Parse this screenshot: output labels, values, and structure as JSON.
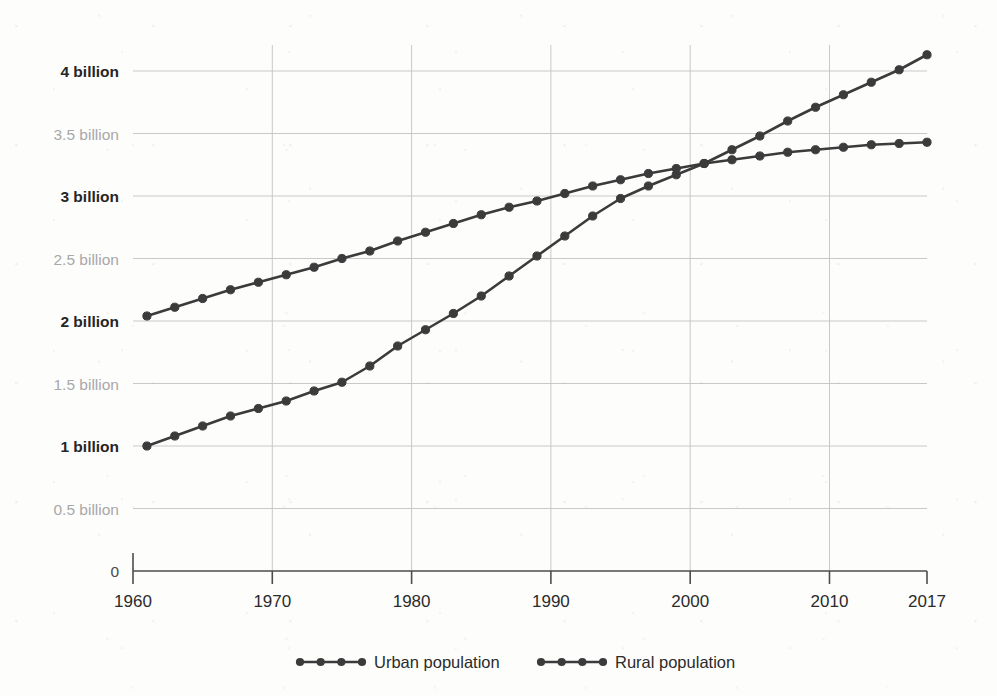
{
  "chart_data": {
    "type": "line",
    "title": "",
    "subtitle": "",
    "xlabel": "",
    "ylabel": "",
    "xlim": [
      1960,
      2017
    ],
    "ylim": [
      0,
      4.25
    ],
    "grid": true,
    "legend_position": "bottom",
    "x_tick_labels": [
      "1960",
      "1970",
      "1980",
      "1990",
      "2000",
      "2010",
      "2017"
    ],
    "x_tick_values": [
      1960,
      1970,
      1980,
      1990,
      2000,
      2010,
      2017
    ],
    "y_tick_labels": [
      "0",
      "0.5 billion",
      "1 billion",
      "1.5 billion",
      "2 billion",
      "2.5 billion",
      "3 billion",
      "3.5 billion",
      "4 billion"
    ],
    "y_tick_values": [
      0,
      0.5,
      1,
      1.5,
      2,
      2.5,
      3,
      3.5,
      4
    ],
    "y_tick_emphasis": [
      "zero",
      "minor",
      "major",
      "minor",
      "major",
      "minor",
      "major",
      "minor",
      "major"
    ],
    "units": "billions of people",
    "marker_interval_years": 2,
    "x": [
      1961,
      1963,
      1965,
      1967,
      1969,
      1971,
      1973,
      1975,
      1977,
      1979,
      1981,
      1983,
      1985,
      1987,
      1989,
      1991,
      1993,
      1995,
      1997,
      1999,
      2001,
      2003,
      2005,
      2007,
      2009,
      2011,
      2013,
      2015,
      2017
    ],
    "series": [
      {
        "name": "Urban population",
        "color": "#3b3b3b",
        "marker": "circle",
        "values": [
          1.0,
          1.08,
          1.16,
          1.24,
          1.3,
          1.36,
          1.44,
          1.51,
          1.64,
          1.8,
          1.93,
          2.06,
          2.2,
          2.36,
          2.52,
          2.68,
          2.84,
          2.98,
          3.08,
          3.17,
          3.26,
          3.37,
          3.48,
          3.6,
          3.71,
          3.81,
          3.91,
          4.01,
          4.13
        ]
      },
      {
        "name": "Rural population",
        "color": "#3b3b3b",
        "marker": "circle",
        "values": [
          2.04,
          2.11,
          2.18,
          2.25,
          2.31,
          2.37,
          2.43,
          2.5,
          2.56,
          2.64,
          2.71,
          2.78,
          2.85,
          2.91,
          2.96,
          3.02,
          3.08,
          3.13,
          3.18,
          3.22,
          3.26,
          3.29,
          3.32,
          3.35,
          3.37,
          3.39,
          3.41,
          3.42,
          3.43
        ]
      }
    ],
    "annotations": [
      {
        "text": "crossover",
        "x": 2002,
        "y": 3.3
      }
    ]
  },
  "legend": {
    "items": [
      {
        "label": "Urban population"
      },
      {
        "label": "Rural population"
      }
    ]
  }
}
